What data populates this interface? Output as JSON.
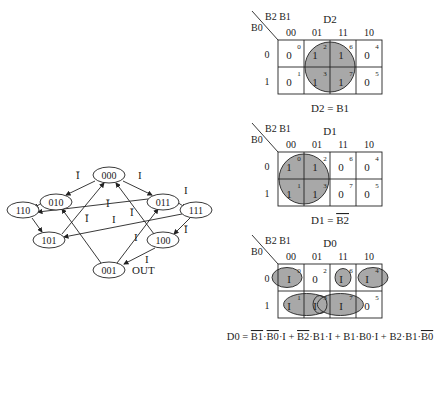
{
  "state_diagram": {
    "states": [
      {
        "id": "000",
        "label": "000",
        "cx": 109,
        "cy": 175
      },
      {
        "id": "010",
        "label": "010",
        "cx": 56,
        "cy": 202
      },
      {
        "id": "011",
        "label": "011",
        "cx": 163,
        "cy": 202
      },
      {
        "id": "110",
        "label": "110",
        "cx": 23,
        "cy": 210
      },
      {
        "id": "111",
        "label": "111",
        "cx": 196,
        "cy": 210
      },
      {
        "id": "101",
        "label": "101",
        "cx": 49,
        "cy": 240
      },
      {
        "id": "100",
        "label": "100",
        "cx": 163,
        "cy": 240
      },
      {
        "id": "001",
        "label": "001",
        "cx": 109,
        "cy": 270
      }
    ],
    "labels": {
      "i": "I",
      "ibar": "Ī",
      "out": "OUT"
    }
  },
  "kmaps": [
    {
      "title": "D2",
      "row_var": "B0",
      "col_var": "B2 B1",
      "col_headers": [
        "00",
        "01",
        "11",
        "10"
      ],
      "row_headers": [
        "0",
        "1"
      ],
      "cells": [
        [
          "0",
          "1",
          "1",
          "0"
        ],
        [
          "0",
          "1",
          "1",
          "0"
        ]
      ],
      "indices": [
        [
          "0",
          "2",
          "6",
          "4"
        ],
        [
          "1",
          "3",
          "7",
          "5"
        ]
      ],
      "equation": "D2 = B1"
    },
    {
      "title": "D1",
      "row_var": "B0",
      "col_var": "B2 B1",
      "col_headers": [
        "00",
        "01",
        "11",
        "10"
      ],
      "row_headers": [
        "0",
        "1"
      ],
      "cells": [
        [
          "1",
          "1",
          "0",
          "0"
        ],
        [
          "1",
          "1",
          "0",
          "0"
        ]
      ],
      "indices": [
        [
          "0",
          "2",
          "6",
          "4"
        ],
        [
          "1",
          "3",
          "7",
          "5"
        ]
      ],
      "equation_prefix": "D1 = ",
      "equation_bar": "B2"
    },
    {
      "title": "D0",
      "row_var": "B0",
      "col_var": "B2 B1",
      "col_headers": [
        "00",
        "01",
        "11",
        "10"
      ],
      "row_headers": [
        "0",
        "1"
      ],
      "cells": [
        [
          "I",
          "0",
          "I",
          "I"
        ],
        [
          "I",
          "I",
          "I",
          "0"
        ]
      ],
      "indices": [
        [
          "0",
          "2",
          "6",
          "4"
        ],
        [
          "1",
          "3",
          "7",
          "5"
        ]
      ],
      "equation_parts": [
        "D0 = ",
        "B1",
        "·",
        "B0",
        "·I + ",
        "B2",
        "·B1·I + B1·B0·I + B2·B1·",
        "B0"
      ]
    }
  ],
  "colors": {
    "fill": "#a8a8a8",
    "line": "#222222"
  }
}
